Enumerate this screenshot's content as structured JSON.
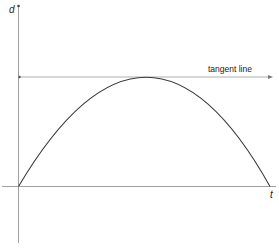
{
  "diagram": {
    "axes": {
      "y_label": "d",
      "x_label": "t"
    },
    "tangent": {
      "label": "tangent line"
    },
    "colors": {
      "axis": "#a0a0a0",
      "curve": "#3a3a3a",
      "tangent": "#b0b0b0",
      "text": "#222222"
    }
  }
}
